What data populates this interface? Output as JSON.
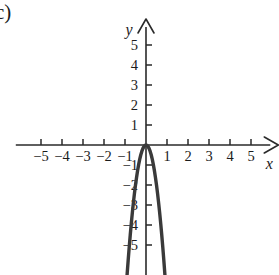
{
  "figure": {
    "part_label": "c)",
    "background_color": "#ffffff",
    "axis_color": "#2a2a2a",
    "curve_color": "#3a3a3a"
  },
  "chart_data": {
    "type": "line",
    "title": "",
    "subtitle": "",
    "xlabel": "x",
    "ylabel": "y",
    "xlim": [
      -6.2,
      6.3
    ],
    "ylim": [
      -6.5,
      6.3
    ],
    "grid": false,
    "legend": "none",
    "x_ticks": [
      -5,
      -4,
      -3,
      -2,
      -1,
      1,
      2,
      3,
      4,
      5
    ],
    "y_ticks": [
      -5,
      -4,
      -3,
      -2,
      -1,
      1,
      2,
      3,
      4,
      5
    ],
    "x_tick_labels": [
      "-5",
      "-4",
      "-3",
      "-2",
      "-1",
      "1",
      "2",
      "3",
      "4",
      "5"
    ],
    "y_tick_labels": [
      "-5",
      "-4",
      "-3",
      "-2",
      "-1",
      "1",
      "2",
      "3",
      "4",
      "5"
    ],
    "axis_arrows": [
      "x-positive",
      "y-positive"
    ],
    "series": [
      {
        "name": "parabola",
        "equation": "y = -8x^2",
        "vertex": [
          0,
          0
        ],
        "opens": "down",
        "x": [
          -0.9,
          -0.85,
          -0.8,
          -0.75,
          -0.7,
          -0.65,
          -0.6,
          -0.55,
          -0.5,
          -0.45,
          -0.4,
          -0.35,
          -0.3,
          -0.25,
          -0.2,
          -0.15,
          -0.1,
          -0.05,
          0,
          0.05,
          0.1,
          0.15,
          0.2,
          0.25,
          0.3,
          0.35,
          0.4,
          0.45,
          0.5,
          0.55,
          0.6,
          0.65,
          0.7,
          0.75,
          0.8,
          0.85,
          0.9
        ],
        "y": [
          -6.48,
          -5.78,
          -5.12,
          -4.5,
          -3.92,
          -3.38,
          -2.88,
          -2.42,
          -2.0,
          -1.62,
          -1.28,
          -0.98,
          -0.72,
          -0.5,
          -0.32,
          -0.18,
          -0.08,
          -0.02,
          0,
          -0.02,
          -0.08,
          -0.18,
          -0.32,
          -0.5,
          -0.72,
          -0.98,
          -1.28,
          -1.62,
          -2.0,
          -2.42,
          -2.88,
          -3.38,
          -3.92,
          -4.5,
          -5.12,
          -5.78,
          -6.48
        ]
      }
    ],
    "annotations": []
  }
}
